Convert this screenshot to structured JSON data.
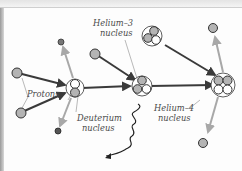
{
  "diagram": {
    "type": "proton-proton fusion chain",
    "labels": {
      "protons": "Protons",
      "deuterium": [
        "Deuterium",
        "nucleus"
      ],
      "helium3": [
        "Helium–3",
        "nucleus"
      ],
      "helium4": [
        "Helium–4",
        "nucleus"
      ]
    },
    "colors": {
      "proton_fill": "#b4b4b4",
      "neutron_fill": "#ffffff",
      "outline": "#2a2a2a",
      "arrow_dark": "#3a3a3a",
      "arrow_light": "#a8a8a8",
      "label_line": "#8a8a8a"
    },
    "nodes": [
      {
        "id": "proton-in-1",
        "kind": "proton"
      },
      {
        "id": "proton-in-2",
        "kind": "proton"
      },
      {
        "id": "deuterium",
        "kind": "nucleus",
        "protons": 1,
        "neutrons": 1
      },
      {
        "id": "positron-out",
        "kind": "positron"
      },
      {
        "id": "neutrino-out",
        "kind": "neutrino"
      },
      {
        "id": "proton-in-3",
        "kind": "proton"
      },
      {
        "id": "helium3-a",
        "kind": "nucleus",
        "protons": 2,
        "neutrons": 1
      },
      {
        "id": "helium3-b",
        "kind": "nucleus",
        "protons": 2,
        "neutrons": 1
      },
      {
        "id": "gamma-ray",
        "kind": "photon"
      },
      {
        "id": "helium4",
        "kind": "nucleus",
        "protons": 2,
        "neutrons": 2
      },
      {
        "id": "proton-out-1",
        "kind": "proton"
      },
      {
        "id": "proton-out-2",
        "kind": "proton"
      }
    ]
  }
}
